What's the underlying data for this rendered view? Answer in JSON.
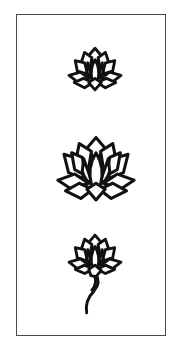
{
  "illustration": {
    "description": "Three black-outline lotus flowers arranged vertically inside a rectangular frame",
    "frame_color": "#4a4a4a",
    "stroke_color": "#111111",
    "background_color": "#ffffff",
    "figures": [
      {
        "name": "small-lotus",
        "position": "top",
        "has_stem": false
      },
      {
        "name": "large-lotus",
        "position": "middle",
        "has_stem": false
      },
      {
        "name": "lotus-with-stem",
        "position": "bottom",
        "has_stem": true
      }
    ]
  }
}
